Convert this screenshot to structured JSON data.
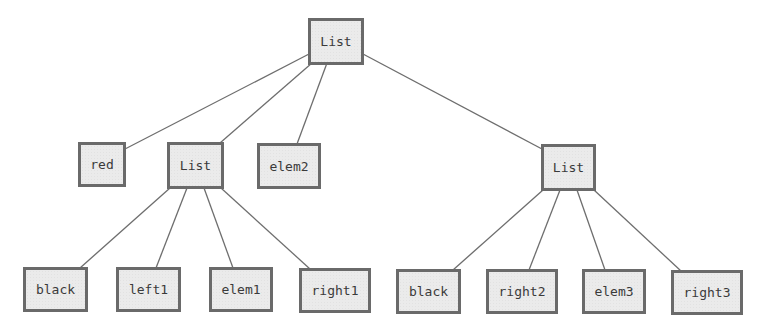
{
  "diagram": {
    "type": "tree",
    "colors": {
      "node_fill": "#ebebeb",
      "node_border": "#6a6a6a",
      "node_text": "#3a3a3a",
      "edge": "#6e6e6e"
    },
    "nodes": [
      {
        "id": "root",
        "label": "List",
        "x": 308,
        "y": 18,
        "w": 56,
        "h": 47
      },
      {
        "id": "red",
        "label": "red",
        "x": 78,
        "y": 142,
        "w": 48,
        "h": 45
      },
      {
        "id": "list_l",
        "label": "List",
        "x": 167,
        "y": 142,
        "w": 57,
        "h": 47
      },
      {
        "id": "elem2",
        "label": "elem2",
        "x": 257,
        "y": 143,
        "w": 64,
        "h": 46
      },
      {
        "id": "list_r",
        "label": "List",
        "x": 541,
        "y": 144,
        "w": 55,
        "h": 47
      },
      {
        "id": "black_l",
        "label": "black",
        "x": 23,
        "y": 267,
        "w": 65,
        "h": 45
      },
      {
        "id": "left1",
        "label": "left1",
        "x": 116,
        "y": 267,
        "w": 65,
        "h": 45
      },
      {
        "id": "elem1",
        "label": "elem1",
        "x": 209,
        "y": 267,
        "w": 64,
        "h": 45
      },
      {
        "id": "right1",
        "label": "right1",
        "x": 299,
        "y": 268,
        "w": 72,
        "h": 45
      },
      {
        "id": "black_r",
        "label": "black",
        "x": 396,
        "y": 269,
        "w": 65,
        "h": 45
      },
      {
        "id": "right2",
        "label": "right2",
        "x": 486,
        "y": 269,
        "w": 72,
        "h": 45
      },
      {
        "id": "elem3",
        "label": "elem3",
        "x": 582,
        "y": 269,
        "w": 64,
        "h": 45
      },
      {
        "id": "right3",
        "label": "right3",
        "x": 671,
        "y": 270,
        "w": 72,
        "h": 45
      }
    ],
    "edges": [
      {
        "from": "root",
        "to": "red",
        "x1": 309,
        "y1": 54,
        "x2": 125,
        "y2": 149
      },
      {
        "from": "root",
        "to": "list_l",
        "x1": 312,
        "y1": 63,
        "x2": 220,
        "y2": 143
      },
      {
        "from": "root",
        "to": "elem2",
        "x1": 327,
        "y1": 63,
        "x2": 297,
        "y2": 144
      },
      {
        "from": "root",
        "to": "list_r",
        "x1": 363,
        "y1": 54,
        "x2": 542,
        "y2": 149
      },
      {
        "from": "list_l",
        "to": "black_l",
        "x1": 170,
        "y1": 188,
        "x2": 80,
        "y2": 268
      },
      {
        "from": "list_l",
        "to": "left1",
        "x1": 187,
        "y1": 188,
        "x2": 156,
        "y2": 268
      },
      {
        "from": "list_l",
        "to": "elem1",
        "x1": 204,
        "y1": 188,
        "x2": 233,
        "y2": 268
      },
      {
        "from": "list_l",
        "to": "right1",
        "x1": 221,
        "y1": 188,
        "x2": 310,
        "y2": 269
      },
      {
        "from": "list_r",
        "to": "black_r",
        "x1": 543,
        "y1": 190,
        "x2": 453,
        "y2": 270
      },
      {
        "from": "list_r",
        "to": "right2",
        "x1": 560,
        "y1": 190,
        "x2": 529,
        "y2": 270
      },
      {
        "from": "list_r",
        "to": "elem3",
        "x1": 577,
        "y1": 190,
        "x2": 605,
        "y2": 270
      },
      {
        "from": "list_r",
        "to": "right3",
        "x1": 594,
        "y1": 190,
        "x2": 681,
        "y2": 271
      }
    ]
  }
}
